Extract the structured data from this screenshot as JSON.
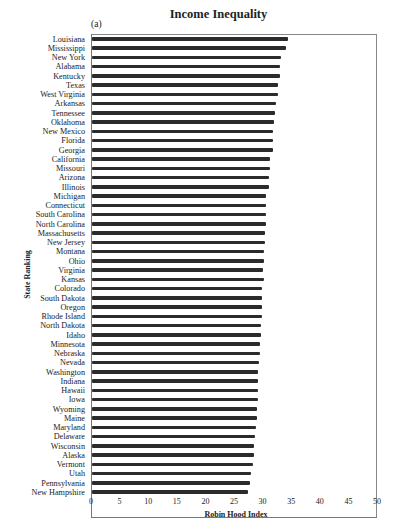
{
  "chart_data": {
    "type": "bar",
    "orientation": "horizontal",
    "title": "Income Inequality",
    "panel_label": "(a)",
    "xlabel": "Robin Hood Index",
    "ylabel": "State Ranking",
    "xlim": [
      0,
      50
    ],
    "xticks": [
      "0",
      "5",
      "10",
      "15",
      "20",
      "25",
      "30",
      "35",
      "40",
      "45",
      "50"
    ],
    "grid": false,
    "legend": null,
    "categories": [
      "Louisiana",
      "Mississippi",
      "New York",
      "Alabama",
      "Kentucky",
      "Texas",
      "West Virginia",
      "Arkansas",
      "Tennessee",
      "Oklahoma",
      "New Mexico",
      "Florida",
      "Georgia",
      "California",
      "Missouri",
      "Arizona",
      "Illinois",
      "Michigan",
      "Connecticut",
      "South Carolina",
      "North Carolina",
      "Massachusetts",
      "New Jersey",
      "Montana",
      "Ohio",
      "Virginia",
      "Kansas",
      "Colorado",
      "South Dakota",
      "Oregon",
      "Rhode Island",
      "North Dakota",
      "Idaho",
      "Minnesota",
      "Nebraska",
      "Nevada",
      "Washington",
      "Indiana",
      "Hawaii",
      "Iowa",
      "Wyoming",
      "Maine",
      "Maryland",
      "Delaware",
      "Wisconsin",
      "Alaska",
      "Vermont",
      "Utah",
      "Pennsylvania",
      "New Hampshire"
    ],
    "values": [
      34.2,
      34.0,
      33.0,
      32.9,
      32.8,
      32.5,
      32.5,
      32.2,
      32.0,
      31.8,
      31.7,
      31.6,
      31.6,
      31.1,
      31.1,
      30.9,
      30.9,
      30.4,
      30.4,
      30.4,
      30.4,
      30.2,
      30.2,
      30.1,
      30.1,
      29.9,
      30.0,
      29.8,
      29.7,
      29.7,
      29.7,
      29.5,
      29.5,
      29.4,
      29.3,
      29.2,
      29.1,
      29.0,
      29.0,
      29.0,
      28.9,
      28.8,
      28.7,
      28.5,
      28.3,
      28.3,
      28.1,
      27.8,
      27.7,
      27.2
    ]
  }
}
